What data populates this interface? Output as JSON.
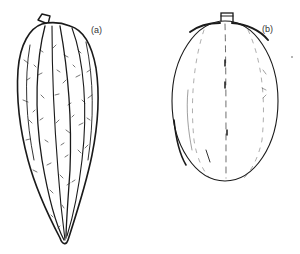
{
  "figure": {
    "panels": [
      {
        "id": "a",
        "label": "(a)",
        "description": "Elongated, deeply ridged and warty cacao pod with pointed tip"
      },
      {
        "id": "b",
        "label": "(b)",
        "description": "Smooth, oval cacao pod with shallow furrows"
      }
    ]
  },
  "colors": {
    "background": "#ffffff",
    "ink": "#1a1a1a",
    "label": "#333333"
  }
}
